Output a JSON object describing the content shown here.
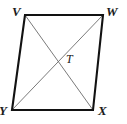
{
  "figure": {
    "kind": "geometry-diagram",
    "shape": "parallelogram",
    "background_color": "#ffffff",
    "outline_color": "#121212",
    "diagonal_color": "#6b6b6b",
    "label_color": "#1b1b1b",
    "outline_width": 2.1,
    "diagonal_width": 0.9,
    "viewbox": "0 0 127 124",
    "vertices": [
      {
        "id": "V",
        "label": "V",
        "x": 25,
        "y": 15,
        "role": "top-left-vertex"
      },
      {
        "id": "W",
        "label": "W",
        "x": 103,
        "y": 15,
        "role": "top-right-vertex"
      },
      {
        "id": "X",
        "label": "X",
        "x": 93,
        "y": 110,
        "role": "bottom-right-vertex"
      },
      {
        "id": "Y",
        "label": "Y",
        "x": 12,
        "y": 110,
        "role": "bottom-left-vertex"
      }
    ],
    "sides": [
      {
        "id": "VW",
        "from": "V",
        "to": "W"
      },
      {
        "id": "WX",
        "from": "W",
        "to": "X"
      },
      {
        "id": "XY",
        "from": "X",
        "to": "Y"
      },
      {
        "id": "YV",
        "from": "Y",
        "to": "V"
      }
    ],
    "diagonals": [
      {
        "id": "VX",
        "from": "V",
        "to": "X"
      },
      {
        "id": "WY",
        "from": "W",
        "to": "Y"
      }
    ],
    "intersection": {
      "id": "T",
      "label": "T",
      "x": 58,
      "y": 58,
      "role": "diagonal-intersection-point"
    },
    "outline_path": "M 25 15 L 103 15 L 93 110 L 12 110 Z",
    "diagonal_vx_path": "M 25 15 L 93 110",
    "diagonal_wy_path": "M 103 15 L 12 110"
  }
}
